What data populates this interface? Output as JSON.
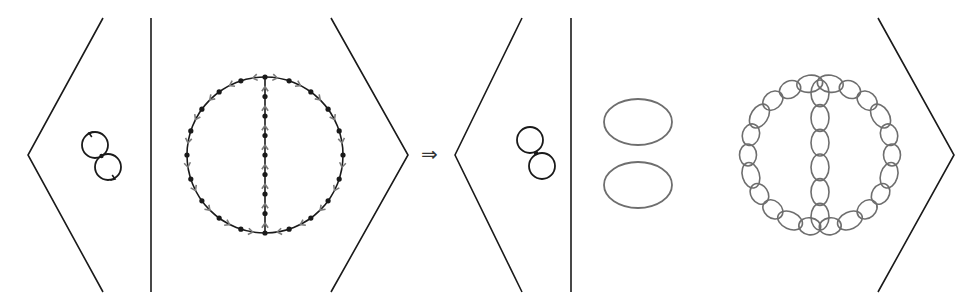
{
  "diagram": {
    "implies_symbol": "⇒",
    "colors": {
      "stroke": "#1a1a1a",
      "arrow": "#7a7a7a",
      "bead": "#6e6e6e",
      "background": "#ffffff"
    },
    "left_expression": {
      "bracket_left": {
        "points": [
          [
            103,
            18
          ],
          [
            28,
            155
          ],
          [
            103,
            292
          ]
        ]
      },
      "divider": {
        "x": 151,
        "y1": 18,
        "y2": 292
      },
      "bracket_right": {
        "points": [
          [
            331,
            18
          ],
          [
            408,
            155
          ],
          [
            331,
            292
          ]
        ]
      },
      "figure_eight": {
        "loops": [
          {
            "cx": 95,
            "cy": 145,
            "r": 13
          },
          {
            "cx": 108,
            "cy": 167,
            "r": 13
          }
        ],
        "has_arrows": true
      },
      "theta_graph": {
        "cx": 265,
        "cy": 155,
        "r": 78,
        "chord_vertices": 7,
        "circle_vertices": 20,
        "has_arrows": true
      }
    },
    "right_expression": {
      "bracket_left": {
        "points": [
          [
            522,
            18
          ],
          [
            455,
            155
          ],
          [
            522,
            292
          ]
        ]
      },
      "divider": {
        "x": 571,
        "y1": 18,
        "y2": 292
      },
      "bracket_right": {
        "points": [
          [
            878,
            18
          ],
          [
            954,
            155
          ],
          [
            878,
            292
          ]
        ]
      },
      "figure_eight": {
        "loops": [
          {
            "cx": 530,
            "cy": 140,
            "r": 13
          },
          {
            "cx": 542,
            "cy": 166,
            "r": 13
          }
        ],
        "has_arrows": false
      },
      "ellipses": [
        {
          "cx": 638,
          "cy": 122,
          "rx": 34,
          "ry": 23
        },
        {
          "cx": 638,
          "cy": 185,
          "rx": 34,
          "ry": 23
        }
      ],
      "bead_theta": {
        "cx": 820,
        "cy": 155,
        "ring_beads": 22,
        "chord_beads": 6
      }
    }
  }
}
